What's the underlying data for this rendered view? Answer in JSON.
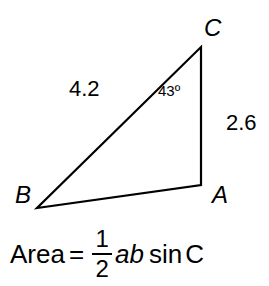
{
  "diagram": {
    "vertices": {
      "A": "A",
      "B": "B",
      "C": "C"
    },
    "sides": {
      "BC": "4.2",
      "CA": "2.6"
    },
    "angle_C": "43º",
    "formula": {
      "lhs": "Area",
      "equals": "=",
      "numerator": "1",
      "denominator": "2",
      "vars": "ab",
      "func": "sin",
      "arg": "C"
    },
    "colors": {
      "stroke": "#000000",
      "background": "#ffffff"
    }
  }
}
